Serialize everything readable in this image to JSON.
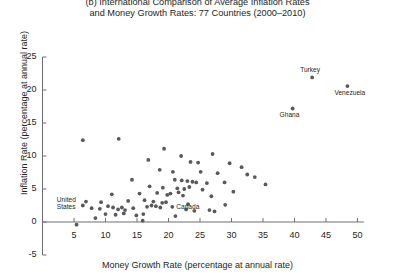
{
  "chart_data": {
    "type": "scatter",
    "title": "(b) International Comparison of Average Inflation Rates and Money Growth Rates: 77 Countries (2000–2010)",
    "title_lines": [
      "(b) International Comparison of Average Inflation Rates",
      "and Money Growth Rates: 77 Countries (2000–2010)"
    ],
    "xlabel": "Money Growth Rate (percentage at annual rate)",
    "ylabel": "Inflation Rate (percentage at annual rate)",
    "xlim": [
      0,
      51
    ],
    "ylim": [
      -5,
      25
    ],
    "xticks": [
      5,
      10,
      15,
      20,
      25,
      30,
      35,
      40,
      45,
      50
    ],
    "yticks": [
      -5,
      0,
      5,
      10,
      15,
      20,
      25
    ],
    "grid": false,
    "legend": "none",
    "marker_color": "#58595b",
    "axis_color": "#6d6e71",
    "n_countries": 77,
    "annotations": [
      {
        "text": "Turkey",
        "x": 42.8,
        "y": 21.9,
        "position": "above"
      },
      {
        "text": "Venezuela",
        "x": 48.4,
        "y": 20.6,
        "position": "below"
      },
      {
        "text": "Ghana",
        "x": 39.7,
        "y": 17.2,
        "position": "below"
      },
      {
        "text": "United States",
        "x": 6.4,
        "y": 2.5,
        "position": "left"
      },
      {
        "text": "Canada",
        "x": 20.6,
        "y": 2.3,
        "position": "right"
      }
    ],
    "points": [
      {
        "x": 42.8,
        "y": 21.9
      },
      {
        "x": 48.4,
        "y": 20.6
      },
      {
        "x": 39.7,
        "y": 17.2
      },
      {
        "x": 6.4,
        "y": 12.4
      },
      {
        "x": 12.1,
        "y": 12.6
      },
      {
        "x": 19.3,
        "y": 11.1
      },
      {
        "x": 22.0,
        "y": 10.0
      },
      {
        "x": 27.0,
        "y": 10.3
      },
      {
        "x": 16.8,
        "y": 9.4
      },
      {
        "x": 23.5,
        "y": 9.1
      },
      {
        "x": 24.7,
        "y": 9.0
      },
      {
        "x": 29.7,
        "y": 8.9
      },
      {
        "x": 31.6,
        "y": 8.3
      },
      {
        "x": 18.6,
        "y": 7.9
      },
      {
        "x": 20.7,
        "y": 7.6
      },
      {
        "x": 25.1,
        "y": 7.6
      },
      {
        "x": 27.8,
        "y": 7.4
      },
      {
        "x": 32.5,
        "y": 7.2
      },
      {
        "x": 33.7,
        "y": 6.8
      },
      {
        "x": 14.2,
        "y": 6.4
      },
      {
        "x": 21.0,
        "y": 6.4
      },
      {
        "x": 22.1,
        "y": 6.3
      },
      {
        "x": 23.0,
        "y": 6.2
      },
      {
        "x": 23.8,
        "y": 6.1
      },
      {
        "x": 24.4,
        "y": 6.0
      },
      {
        "x": 26.1,
        "y": 5.9
      },
      {
        "x": 28.9,
        "y": 6.0
      },
      {
        "x": 35.4,
        "y": 5.7
      },
      {
        "x": 17.0,
        "y": 5.4
      },
      {
        "x": 19.1,
        "y": 5.2
      },
      {
        "x": 21.4,
        "y": 5.1
      },
      {
        "x": 22.5,
        "y": 5.0
      },
      {
        "x": 23.3,
        "y": 5.3
      },
      {
        "x": 25.4,
        "y": 4.9
      },
      {
        "x": 30.3,
        "y": 4.6
      },
      {
        "x": 11.0,
        "y": 4.2
      },
      {
        "x": 15.4,
        "y": 4.3
      },
      {
        "x": 18.2,
        "y": 4.4
      },
      {
        "x": 19.8,
        "y": 4.1
      },
      {
        "x": 20.3,
        "y": 4.3
      },
      {
        "x": 21.6,
        "y": 4.5
      },
      {
        "x": 22.3,
        "y": 4.0
      },
      {
        "x": 26.8,
        "y": 3.9
      },
      {
        "x": 6.9,
        "y": 3.1
      },
      {
        "x": 9.3,
        "y": 3.0
      },
      {
        "x": 13.6,
        "y": 3.2
      },
      {
        "x": 16.2,
        "y": 3.3
      },
      {
        "x": 17.6,
        "y": 3.1
      },
      {
        "x": 19.0,
        "y": 2.9
      },
      {
        "x": 19.6,
        "y": 3.0
      },
      {
        "x": 23.1,
        "y": 2.7
      },
      {
        "x": 29.0,
        "y": 2.6
      },
      {
        "x": 6.4,
        "y": 2.5
      },
      {
        "x": 7.8,
        "y": 2.1
      },
      {
        "x": 9.1,
        "y": 2.0
      },
      {
        "x": 10.4,
        "y": 2.4
      },
      {
        "x": 11.2,
        "y": 2.2
      },
      {
        "x": 12.0,
        "y": 1.9
      },
      {
        "x": 12.6,
        "y": 2.2
      },
      {
        "x": 13.1,
        "y": 1.8
      },
      {
        "x": 14.4,
        "y": 2.1
      },
      {
        "x": 16.6,
        "y": 2.3
      },
      {
        "x": 17.3,
        "y": 2.5
      },
      {
        "x": 18.0,
        "y": 2.4
      },
      {
        "x": 18.7,
        "y": 2.2
      },
      {
        "x": 20.6,
        "y": 2.3
      },
      {
        "x": 22.8,
        "y": 1.9
      },
      {
        "x": 24.1,
        "y": 1.7
      },
      {
        "x": 26.5,
        "y": 1.8
      },
      {
        "x": 27.3,
        "y": 1.6
      },
      {
        "x": 10.0,
        "y": 1.2
      },
      {
        "x": 11.6,
        "y": 1.1
      },
      {
        "x": 12.9,
        "y": 1.3
      },
      {
        "x": 14.9,
        "y": 1.0
      },
      {
        "x": 16.0,
        "y": 1.2
      },
      {
        "x": 21.1,
        "y": 0.9
      },
      {
        "x": 8.4,
        "y": 0.6
      },
      {
        "x": 15.9,
        "y": 0.2
      },
      {
        "x": 5.4,
        "y": -0.4
      }
    ]
  }
}
